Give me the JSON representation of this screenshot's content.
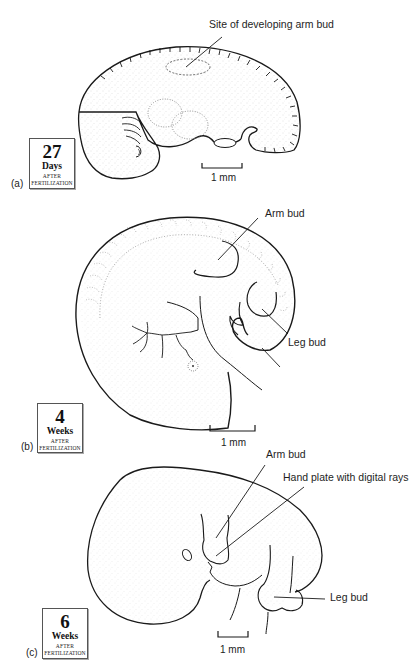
{
  "figure": {
    "panels": [
      {
        "id": "a",
        "panel_label": "(a)",
        "age_box": {
          "number": "27",
          "unit": "Days",
          "after": "AFTER",
          "fertilization": "FERTILIZATION"
        },
        "annotations": [
          "Site of developing arm bud"
        ],
        "scale_bar": "1 mm"
      },
      {
        "id": "b",
        "panel_label": "(b)",
        "age_box": {
          "number": "4",
          "unit": "Weeks",
          "after": "AFTER",
          "fertilization": "FERTILIZATION"
        },
        "annotations": [
          "Arm bud",
          "Leg bud"
        ],
        "scale_bar": "1 mm"
      },
      {
        "id": "c",
        "panel_label": "(c)",
        "age_box": {
          "number": "6",
          "unit": "Weeks",
          "after": "AFTER",
          "fertilization": "FERTILIZATION"
        },
        "annotations": [
          "Arm bud",
          "Hand plate with digital rays",
          "Leg bud"
        ],
        "scale_bar": "1 mm"
      }
    ],
    "colors": {
      "ink": "#1a1a1a",
      "stipple": "#9a9a9a",
      "background": "#ffffff"
    }
  }
}
